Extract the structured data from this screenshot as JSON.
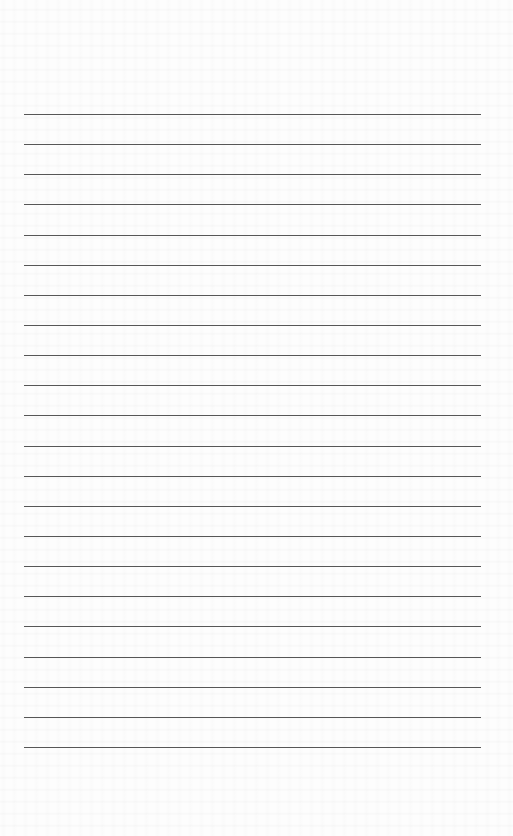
{
  "page": {
    "type": "blank-lined-sheet",
    "width": 513,
    "height": 836,
    "background_color": "#fdfdfd",
    "rule_color": "#3a3a3a",
    "rules": {
      "count": 22,
      "left": 24,
      "right": 481,
      "first_y": 114,
      "spacing": 30.14
    }
  }
}
